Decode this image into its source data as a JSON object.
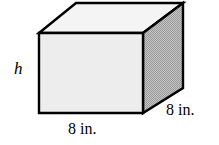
{
  "figure": {
    "type": "rectangular-prism",
    "labels": {
      "height": "h",
      "width": "8 in.",
      "depth": "8 in."
    },
    "colors": {
      "background": "#ffffff",
      "outline": "#000000",
      "front_face": "#ededed",
      "top_face": "#f4f4f4",
      "side_face": "#b4b4b4"
    },
    "geometry": {
      "front_face": "39,33 143,33 143,113 39,113",
      "top_face": "39,33 76,3 183,3 143,33",
      "side_face": "143,33 183,3 183,88 143,113",
      "front_top_left": [
        39,
        33
      ],
      "front_top_right": [
        143,
        33
      ],
      "front_bottom_left": [
        39,
        113
      ],
      "front_bottom_right": [
        143,
        113
      ],
      "back_top_left": [
        76,
        3
      ],
      "back_top_right": [
        183,
        3
      ],
      "back_bottom_right": [
        183,
        88
      ]
    }
  }
}
